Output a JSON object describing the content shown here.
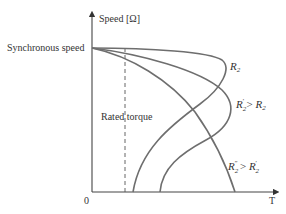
{
  "diagram": {
    "type": "torque-speed characteristics",
    "y_axis_label": "Speed [Ω]",
    "x_axis_label": "T",
    "origin_label": "0",
    "sync_speed_label": "Synchronous speed",
    "rated_torque_label": "Rated torque",
    "curves": [
      {
        "name": "R2",
        "label": "R",
        "sub": "2",
        "tail": ""
      },
      {
        "name": "R2-prime",
        "label": "R",
        "sub": "2",
        "sup": "′",
        "tail": " > R",
        "tail_sub": "2"
      },
      {
        "name": "R2-double-prime",
        "label": "R",
        "sub": "2",
        "sup": "″",
        "tail": " > R",
        "tail_sub": "2",
        "tail_sup": "′"
      }
    ],
    "line_color": "#6e6e6e"
  }
}
